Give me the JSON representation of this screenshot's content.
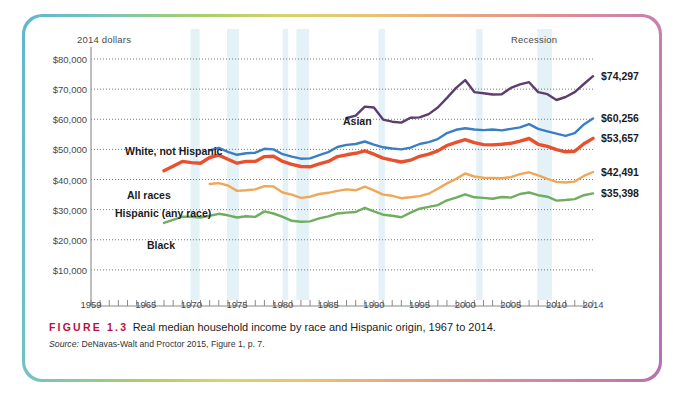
{
  "figure": {
    "tag": "FIGURE 1.3",
    "caption": "Real median household income by race and Hispanic origin, 1967 to 2014.",
    "source_word": "Source:",
    "source_text": "DeNavas-Walt and Proctor 2015, Figure 1, p. 7."
  },
  "notes": {
    "units": "2014 dollars",
    "recession": "Recession"
  },
  "series_labels": {
    "asian": "Asian",
    "white": "White, not Hispanic",
    "all": "All races",
    "hispanic": "Hispanic (any race)",
    "black": "Black"
  },
  "end_labels": {
    "asian": "$74,297",
    "white": "$60,256",
    "all": "$53,657",
    "hispanic": "$42,491",
    "black": "$35,398"
  },
  "colors": {
    "asian": "#5d3c6e",
    "white": "#3a7ec4",
    "all": "#e8502e",
    "hispanic": "#f0a858",
    "black": "#6eae5e",
    "gridline": "#777777",
    "axis": "#8a8a8a",
    "recession_band": "#d9edf5",
    "figure_tag": "#b5123e"
  },
  "chart_data": {
    "type": "line",
    "title": "Real median household income by race and Hispanic origin, 1967 to 2014",
    "xlabel": "",
    "ylabel": "2014 dollars",
    "xlim": [
      1959,
      2014
    ],
    "ylim": [
      0,
      80000
    ],
    "ytick_values": [
      10000,
      20000,
      30000,
      40000,
      50000,
      60000,
      70000,
      80000
    ],
    "ytick_labels": [
      "$10,000",
      "$20,000",
      "$30,000",
      "$40,000",
      "$50,000",
      "$60,000",
      "$70,000",
      "$80,000"
    ],
    "xtick_labels": [
      "1959",
      "1965",
      "1970",
      "1975",
      "1980",
      "1985",
      "1990",
      "1995",
      "2000",
      "2005",
      "2010",
      "2014"
    ],
    "xtick_label_years": [
      1959,
      1965,
      1970,
      1975,
      1980,
      1985,
      1990,
      1995,
      2000,
      2005,
      2010,
      2014
    ],
    "xtick_minor_step": 1,
    "grid": "horizontal-dotted",
    "legend": "inline-labels",
    "recession_bands": [
      [
        1969.9,
        1970.9
      ],
      [
        1973.9,
        1975.2
      ],
      [
        1980.0,
        1980.6
      ],
      [
        1981.5,
        1982.9
      ],
      [
        1990.5,
        1991.2
      ],
      [
        2001.2,
        2001.9
      ],
      [
        2007.9,
        2009.5
      ]
    ],
    "series": [
      {
        "name": "Asian",
        "color": "#5d3c6e",
        "x": [
          1987,
          1988,
          1989,
          1990,
          1991,
          1992,
          1993,
          1994,
          1995,
          1996,
          1997,
          1998,
          1999,
          2000,
          2001,
          2002,
          2003,
          2004,
          2005,
          2006,
          2007,
          2008,
          2009,
          2010,
          2011,
          2012,
          2013,
          2014
        ],
        "values": [
          60400,
          61200,
          64200,
          63900,
          59900,
          59200,
          58900,
          60500,
          60600,
          61700,
          63900,
          67100,
          70400,
          73000,
          69000,
          68600,
          68200,
          68300,
          70400,
          71600,
          72300,
          69000,
          68300,
          66400,
          67400,
          69000,
          71700,
          74297
        ]
      },
      {
        "name": "White, not Hispanic",
        "color": "#3a7ec4",
        "x": [
          1972,
          1973,
          1974,
          1975,
          1976,
          1977,
          1978,
          1979,
          1980,
          1981,
          1982,
          1983,
          1984,
          1985,
          1986,
          1987,
          1988,
          1989,
          1990,
          1991,
          1992,
          1993,
          1994,
          1995,
          1996,
          1997,
          1998,
          1999,
          2000,
          2001,
          2002,
          2003,
          2004,
          2005,
          2006,
          2007,
          2008,
          2009,
          2010,
          2011,
          2012,
          2013,
          2014
        ],
        "values": [
          49700,
          50500,
          49200,
          48200,
          48700,
          48900,
          50200,
          50000,
          48400,
          47600,
          46900,
          47000,
          48100,
          49100,
          50800,
          51500,
          51800,
          52600,
          51600,
          50700,
          50300,
          50000,
          50600,
          51800,
          52400,
          53400,
          55400,
          56500,
          57000,
          56600,
          56400,
          56600,
          56300,
          56800,
          57300,
          58400,
          56800,
          56000,
          55200,
          54500,
          55400,
          58300,
          60256
        ]
      },
      {
        "name": "All races",
        "color": "#e8502e",
        "x": [
          1967,
          1968,
          1969,
          1970,
          1971,
          1972,
          1973,
          1974,
          1975,
          1976,
          1977,
          1978,
          1979,
          1980,
          1981,
          1982,
          1983,
          1984,
          1985,
          1986,
          1987,
          1988,
          1989,
          1990,
          1991,
          1992,
          1993,
          1994,
          1995,
          1996,
          1997,
          1998,
          1999,
          2000,
          2001,
          2002,
          2003,
          2004,
          2005,
          2006,
          2007,
          2008,
          2009,
          2010,
          2011,
          2012,
          2013,
          2014
        ],
        "values": [
          42900,
          44400,
          46000,
          45600,
          45400,
          47300,
          48100,
          46700,
          45400,
          46000,
          46000,
          47600,
          47700,
          46000,
          45000,
          44300,
          44200,
          45200,
          46000,
          47600,
          48200,
          48700,
          49500,
          48400,
          47100,
          46400,
          45800,
          46400,
          47700,
          48400,
          49500,
          51300,
          52300,
          53200,
          52200,
          51600,
          51500,
          51700,
          52000,
          52700,
          53600,
          51700,
          51000,
          49900,
          49200,
          49400,
          51900,
          53657
        ]
      },
      {
        "name": "Hispanic (any race)",
        "color": "#f0a858",
        "x": [
          1972,
          1973,
          1974,
          1975,
          1976,
          1977,
          1978,
          1979,
          1980,
          1981,
          1982,
          1983,
          1984,
          1985,
          1986,
          1987,
          1988,
          1989,
          1990,
          1991,
          1992,
          1993,
          1994,
          1995,
          1996,
          1997,
          1998,
          1999,
          2000,
          2001,
          2002,
          2003,
          2004,
          2005,
          2006,
          2007,
          2008,
          2009,
          2010,
          2011,
          2012,
          2013,
          2014
        ],
        "values": [
          38500,
          38800,
          38000,
          36200,
          36400,
          36700,
          37800,
          37700,
          35700,
          35000,
          33900,
          34300,
          35200,
          35600,
          36200,
          36700,
          36400,
          37600,
          36400,
          35000,
          34600,
          33800,
          34100,
          34500,
          35300,
          36900,
          38700,
          40200,
          42000,
          41000,
          40600,
          40500,
          40400,
          40800,
          41800,
          42400,
          41400,
          40200,
          39200,
          39000,
          39300,
          41200,
          42491
        ]
      },
      {
        "name": "Black",
        "color": "#6eae5e",
        "x": [
          1967,
          1968,
          1969,
          1970,
          1971,
          1972,
          1973,
          1974,
          1975,
          1976,
          1977,
          1978,
          1979,
          1980,
          1981,
          1982,
          1983,
          1984,
          1985,
          1986,
          1987,
          1988,
          1989,
          1990,
          1991,
          1992,
          1993,
          1994,
          1995,
          1996,
          1997,
          1998,
          1999,
          2000,
          2001,
          2002,
          2003,
          2004,
          2005,
          2006,
          2007,
          2008,
          2009,
          2010,
          2011,
          2012,
          2013,
          2014
        ],
        "values": [
          25600,
          26600,
          27700,
          27600,
          27400,
          28000,
          28600,
          28100,
          27400,
          27800,
          27600,
          29400,
          28700,
          27600,
          26300,
          26000,
          26100,
          27100,
          27800,
          28700,
          29000,
          29200,
          30600,
          29400,
          28300,
          28000,
          27500,
          29000,
          30300,
          30900,
          31500,
          33100,
          34000,
          35100,
          34100,
          33900,
          33600,
          34200,
          34000,
          35200,
          35700,
          34800,
          34300,
          33000,
          33200,
          33500,
          34800,
          35398
        ]
      }
    ]
  }
}
